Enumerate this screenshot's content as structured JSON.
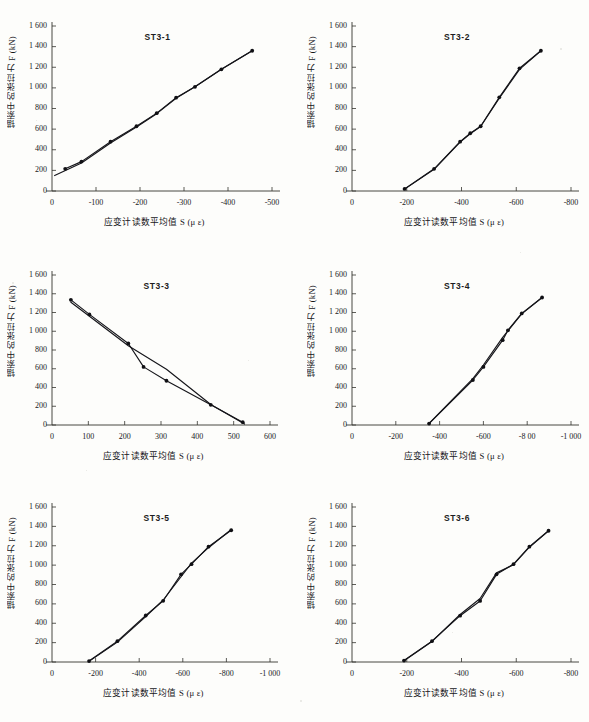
{
  "figure": {
    "axis_label_y": "锚索中的张拉力 F (kN)",
    "axis_label_x": "应变计读数平均值 S (μ ε)",
    "axis_label_x_tight": "应变计读数平均值 S (μ ε)",
    "y_ticks": [
      "0",
      "200",
      "400",
      "600",
      "800",
      "1 000",
      "1 200",
      "1 400",
      "1 600"
    ],
    "ylim": [
      0,
      1600
    ]
  },
  "chart_data": [
    {
      "type": "line",
      "title": "ST3-1",
      "xlabel": "应变计读数平均值 S (μ ε)",
      "ylabel": "锚索中的张拉力 F (kN)",
      "xlim": [
        0,
        -500
      ],
      "ylim": [
        0,
        1600
      ],
      "x_ticks": [
        "0",
        "-100",
        "-200",
        "-300",
        "-400",
        "-500"
      ],
      "x_tick_values": [
        0,
        -100,
        -200,
        -300,
        -400,
        -500
      ],
      "y_ticks": [
        "0",
        "200",
        "400",
        "600",
        "800",
        "1 000",
        "1 200",
        "1 400",
        "1 600"
      ],
      "grid": false,
      "legend": "none",
      "series": [
        {
          "name": "loading",
          "x": [
            -30,
            -67,
            -133,
            -192,
            -238,
            -282,
            -325,
            -385,
            -455
          ],
          "y": [
            215,
            285,
            478,
            628,
            755,
            905,
            1010,
            1180,
            1360
          ]
        },
        {
          "name": "unloading",
          "x": [
            -455,
            -385,
            -325,
            -282,
            -238,
            -192,
            -133,
            -67,
            -6
          ],
          "y": [
            1360,
            1180,
            1010,
            900,
            750,
            620,
            465,
            272,
            150
          ]
        }
      ],
      "markers": {
        "x": [
          -30,
          -67,
          -133,
          -192,
          -238,
          -282,
          -325,
          -385,
          -455
        ],
        "y": [
          215,
          285,
          478,
          628,
          755,
          905,
          1010,
          1180,
          1360
        ]
      }
    },
    {
      "type": "line",
      "title": "ST3-2",
      "xlabel": "应变计读数平均值 S (μ ε)",
      "ylabel": "锚索中的张拉力 F (kN)",
      "xlim": [
        0,
        -800
      ],
      "ylim": [
        0,
        1600
      ],
      "x_ticks": [
        "0",
        "-200",
        "-400",
        "-600",
        "-800"
      ],
      "x_tick_values": [
        0,
        -200,
        -400,
        -600,
        -800
      ],
      "y_ticks": [
        "0",
        "200",
        "400",
        "600",
        "800",
        "1 000",
        "1 200",
        "1 400",
        "1 600"
      ],
      "grid": false,
      "legend": "none",
      "series": [
        {
          "name": "loading",
          "x": [
            -192,
            -300,
            -395,
            -432,
            -470,
            -538,
            -612,
            -690
          ],
          "y": [
            20,
            215,
            478,
            560,
            628,
            908,
            1190,
            1360
          ]
        },
        {
          "name": "unloading",
          "x": [
            -690,
            -612,
            -538,
            -470,
            -432,
            -395,
            -300,
            -192
          ],
          "y": [
            1360,
            1180,
            900,
            625,
            555,
            475,
            210,
            18
          ]
        }
      ],
      "markers": {
        "x": [
          -192,
          -300,
          -395,
          -432,
          -470,
          -538,
          -612,
          -690
        ],
        "y": [
          20,
          215,
          478,
          560,
          628,
          908,
          1190,
          1360
        ]
      }
    },
    {
      "type": "line",
      "title": "ST3-3",
      "xlabel": "应变计读数平均值 S (μ ε)",
      "ylabel": "锚索中的张拉力 F (kN)",
      "xlim": [
        0,
        600
      ],
      "ylim": [
        0,
        1600
      ],
      "x_ticks": [
        "0",
        "100",
        "200",
        "300",
        "400",
        "500",
        "600"
      ],
      "x_tick_values": [
        0,
        100,
        200,
        300,
        400,
        500,
        600
      ],
      "y_ticks": [
        "0",
        "200",
        "400",
        "600",
        "800",
        "1 000",
        "1 200",
        "1 400",
        "1 600"
      ],
      "grid": false,
      "legend": "none",
      "series": [
        {
          "name": "loading",
          "x": [
            52,
            103,
            210,
            252,
            315,
            437,
            525
          ],
          "y": [
            1335,
            1180,
            870,
            620,
            472,
            215,
            30
          ]
        },
        {
          "name": "unloading",
          "x": [
            52,
            103,
            210,
            315,
            437,
            530
          ],
          "y": [
            1310,
            1160,
            845,
            595,
            218,
            10
          ]
        }
      ],
      "markers": {
        "x": [
          52,
          103,
          210,
          252,
          315,
          437,
          525
        ],
        "y": [
          1335,
          1180,
          870,
          620,
          472,
          215,
          30
        ]
      }
    },
    {
      "type": "line",
      "title": "ST3-4",
      "xlabel": "应变计读数平均值 S (μ ε)",
      "ylabel": "锚索中的张拉力 F (kN)",
      "xlim": [
        0,
        -1000
      ],
      "ylim": [
        0,
        1600
      ],
      "x_ticks": [
        "0",
        "-200",
        "-400",
        "-600",
        "-8 00",
        "-1 000"
      ],
      "x_tick_values": [
        0,
        -200,
        -400,
        -600,
        -800,
        -1000
      ],
      "y_ticks": [
        "0",
        "200",
        "400",
        "600",
        "800",
        "1 000",
        "1 200",
        "1 400",
        "1 600"
      ],
      "grid": false,
      "legend": "none",
      "series": [
        {
          "name": "loading",
          "x": [
            -352,
            -552,
            -600,
            -688,
            -712,
            -775,
            -868
          ],
          "y": [
            15,
            480,
            620,
            905,
            1010,
            1190,
            1360
          ]
        },
        {
          "name": "unloading",
          "x": [
            -868,
            -775,
            -712,
            -688,
            -600,
            -552,
            -352
          ],
          "y": [
            1360,
            1185,
            1005,
            935,
            640,
            495,
            18
          ]
        }
      ],
      "markers": {
        "x": [
          -352,
          -552,
          -600,
          -688,
          -712,
          -775,
          -868
        ],
        "y": [
          15,
          480,
          620,
          905,
          1010,
          1190,
          1360
        ]
      }
    },
    {
      "type": "line",
      "title": "ST3-5",
      "xlabel": "应变计读数平均值 S (μ ε)",
      "ylabel": "锚索中的张拉力 F (kN)",
      "xlim": [
        0,
        -1000
      ],
      "ylim": [
        0,
        1600
      ],
      "x_ticks": [
        "0",
        "-200",
        "-400",
        "-600",
        "-800",
        "-1 000"
      ],
      "x_tick_values": [
        0,
        -200,
        -400,
        -600,
        -800,
        -1000
      ],
      "y_ticks": [
        "0",
        "200",
        "400",
        "600",
        "800",
        "1 000",
        "1 200",
        "1 400",
        "1 600"
      ],
      "grid": false,
      "legend": "none",
      "series": [
        {
          "name": "loading",
          "x": [
            -170,
            -300,
            -430,
            -510,
            -592,
            -640,
            -718,
            -822
          ],
          "y": [
            10,
            215,
            480,
            632,
            905,
            1010,
            1190,
            1360
          ]
        },
        {
          "name": "unloading",
          "x": [
            -822,
            -718,
            -640,
            -592,
            -510,
            -430,
            -300,
            -170
          ],
          "y": [
            1368,
            1180,
            1020,
            880,
            640,
            468,
            205,
            8
          ]
        }
      ],
      "markers": {
        "x": [
          -170,
          -300,
          -430,
          -510,
          -592,
          -640,
          -718,
          -822
        ],
        "y": [
          10,
          215,
          480,
          632,
          905,
          1010,
          1190,
          1360
        ]
      }
    },
    {
      "type": "line",
      "title": "ST3-6",
      "xlabel": "应变计读数平均值 S (μ ε)",
      "ylabel": "锚索中的张拉力 F (kN)",
      "xlim": [
        0,
        -800
      ],
      "ylim": [
        0,
        1600
      ],
      "x_ticks": [
        "0",
        "-200",
        "-400",
        "-600",
        "-800"
      ],
      "x_tick_values": [
        0,
        -200,
        -400,
        -600,
        -800
      ],
      "y_ticks": [
        "0",
        "200",
        "400",
        "600",
        "800",
        "1 000",
        "1 200",
        "1 400",
        "1 600"
      ],
      "grid": false,
      "legend": "none",
      "series": [
        {
          "name": "loading",
          "x": [
            -190,
            -292,
            -395,
            -468,
            -528,
            -590,
            -648,
            -718
          ],
          "y": [
            15,
            215,
            478,
            630,
            905,
            1010,
            1190,
            1355
          ]
        },
        {
          "name": "unloading",
          "x": [
            -718,
            -648,
            -590,
            -528,
            -468,
            -395,
            -292,
            -190
          ],
          "y": [
            1355,
            1185,
            1005,
            920,
            655,
            490,
            212,
            12
          ]
        }
      ],
      "markers": {
        "x": [
          -190,
          -292,
          -395,
          -468,
          -528,
          -590,
          -648,
          -718
        ],
        "y": [
          15,
          215,
          478,
          630,
          905,
          1010,
          1190,
          1355
        ]
      }
    }
  ]
}
